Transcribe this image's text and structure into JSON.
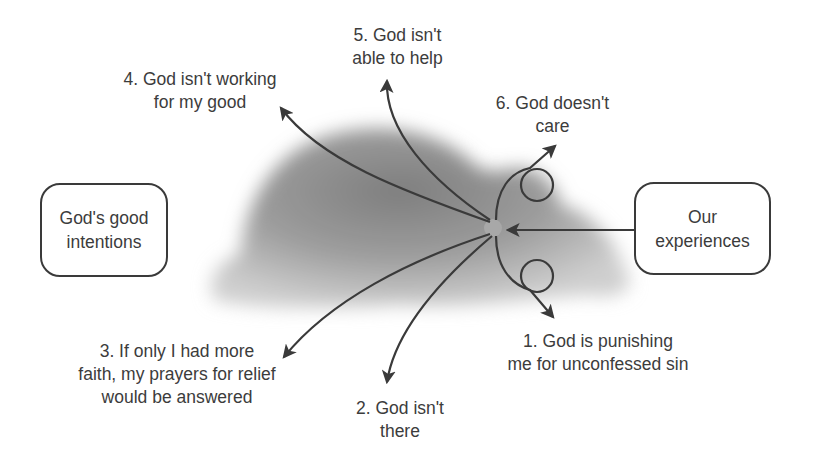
{
  "diagram": {
    "colors": {
      "stroke": "#3a3a3a",
      "text": "#3c3c3c",
      "cloud": "#8a8a8a",
      "background": "#ffffff"
    },
    "boxes": {
      "left": {
        "label": "God's good\nintentions"
      },
      "right": {
        "label": "Our\nexperiences"
      }
    },
    "labels": [
      {
        "id": 1,
        "text": "1. God is punishing\nme for unconfessed sin"
      },
      {
        "id": 2,
        "text": "2. God isn't\nthere"
      },
      {
        "id": 3,
        "text": "3. If only I had more\nfaith, my prayers for relief\nwould be answered"
      },
      {
        "id": 4,
        "text": "4. God isn't working\nfor my good"
      },
      {
        "id": 5,
        "text": "5. God isn't\nable to help"
      },
      {
        "id": 6,
        "text": "6. God doesn't\ncare"
      }
    ],
    "elements": {
      "cloud": "cloud-of-misconceptions",
      "center_point": "convergence-point",
      "arrow_icons": [
        "arrowhead-icon"
      ],
      "loop_icons": [
        "loop-circle-icon"
      ]
    }
  }
}
